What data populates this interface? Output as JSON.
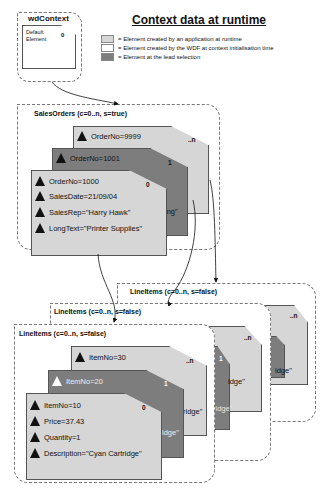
{
  "title": "Context data at runtime",
  "legend": [
    {
      "label": "= Element created by an application at runtime",
      "color": "#d6d6d6"
    },
    {
      "label": "= Element created by the WDF at context initialisation time",
      "color": "#ffffff"
    },
    {
      "label": "= Element at the lead selection",
      "color": "#7d7d7d"
    }
  ],
  "root": {
    "name": "wdContext",
    "element_label_1": "Default",
    "element_label_2": "Element",
    "index": "0"
  },
  "sales_orders": {
    "title": "SalesOrders (c=0..n, s=true)",
    "cards": [
      {
        "index": "..n",
        "attr": "OrderNo=9999"
      },
      {
        "index": "1",
        "attr": "OrderNo=1001",
        "fragment": "ing\""
      },
      {
        "index": "0",
        "attrs": [
          "OrderNo=1000",
          "SalesDate=21/09/04",
          "SalesRep=\"Harry Hawk\"",
          "LongText=\"Printer Supplies\""
        ]
      }
    ]
  },
  "line_items": {
    "title": "LineItems (c=0..n, s=false)",
    "back_titles": [
      "LineItems (c=0..n, s=false)",
      "LineItems (c=0..n, s=false)"
    ],
    "cards": [
      {
        "index": "..n",
        "attr": "ItemNo=30"
      },
      {
        "index": "1",
        "attr": "ItemNo=20",
        "fragment": "idge\""
      },
      {
        "index": "0",
        "attrs": [
          "ItemNo=10",
          "Price=37.43",
          "Quantity=1",
          "Description=\"Cyan Cartridge\""
        ]
      }
    ],
    "fragments": [
      "ridge\"",
      "ridge\"",
      "idge\"",
      "idge\"",
      "ridge\""
    ],
    "back_indices": [
      "..n",
      "..n",
      "1"
    ]
  },
  "colors": {
    "app": "#d6d6d6",
    "wdf": "#ffffff",
    "lead": "#7d7d7d",
    "border": "#555555"
  }
}
